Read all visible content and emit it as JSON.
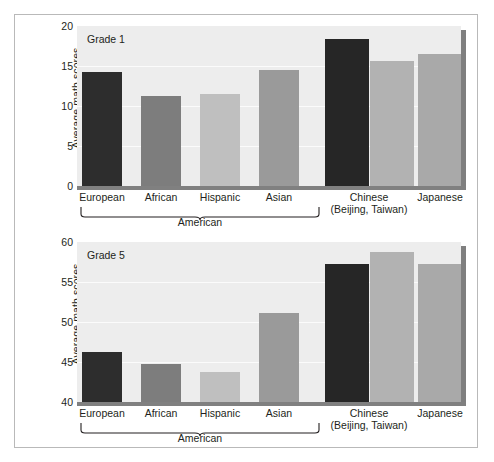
{
  "figure": {
    "panels": [
      {
        "panel_label": "Grade 1",
        "y_axis_title": "Average math scores",
        "y_ticks": [
          "0",
          "5",
          "10",
          "15",
          "20"
        ],
        "group_label": "American"
      },
      {
        "panel_label": "Grade 5",
        "y_axis_title": "Average math scores",
        "y_ticks": [
          "40",
          "45",
          "50",
          "55",
          "60"
        ],
        "group_label": "American"
      }
    ],
    "x_labels": [
      {
        "line1": "European",
        "line2": ""
      },
      {
        "line1": "African",
        "line2": ""
      },
      {
        "line1": "Hispanic",
        "line2": ""
      },
      {
        "line1": "Asian",
        "line2": ""
      },
      {
        "line1": "Chinese",
        "line2": "(Beijing, Taiwan)"
      },
      {
        "line1": "Japanese",
        "line2": ""
      }
    ]
  },
  "chart_data": [
    {
      "type": "bar",
      "title": "Grade 1",
      "xlabel": "",
      "ylabel": "Average math scores",
      "categories": [
        "European",
        "African",
        "Hispanic",
        "Asian",
        "Chinese (Beijing)",
        "Chinese (Taiwan)",
        "Japanese"
      ],
      "values": [
        14.2,
        11.3,
        11.5,
        14.5,
        18.4,
        15.6,
        16.5
      ],
      "bar_colors": [
        "#2d2d2d",
        "#7d7d7d",
        "#bfbfbf",
        "#9a9a9a",
        "#262626",
        "#b2b2b2",
        "#a9a9a9"
      ],
      "ylim": [
        0,
        20
      ],
      "yticks": [
        0,
        5,
        10,
        15,
        20
      ],
      "grid": true,
      "legend": "none"
    },
    {
      "type": "bar",
      "title": "Grade 5",
      "xlabel": "",
      "ylabel": "Average math scores",
      "categories": [
        "European",
        "African",
        "Hispanic",
        "Asian",
        "Chinese (Beijing)",
        "Chinese (Taiwan)",
        "Japanese"
      ],
      "values": [
        46.2,
        44.8,
        43.8,
        51.1,
        57.3,
        58.7,
        57.3
      ],
      "bar_colors": [
        "#2d2d2d",
        "#7d7d7d",
        "#bfbfbf",
        "#9a9a9a",
        "#262626",
        "#b2b2b2",
        "#a9a9a9"
      ],
      "ylim": [
        40,
        60
      ],
      "yticks": [
        40,
        45,
        50,
        55,
        60
      ],
      "grid": true,
      "legend": "none"
    }
  ]
}
